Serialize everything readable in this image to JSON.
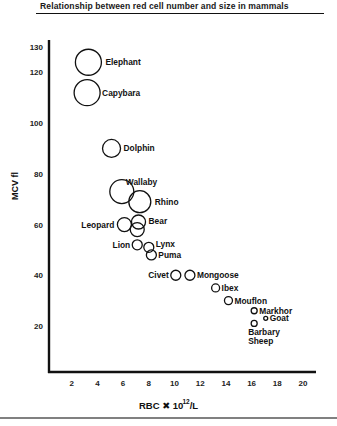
{
  "chart_data": {
    "type": "scatter",
    "title": "Relationship between red cell number and size in mammals",
    "xlabel": "RBC × 10^12/L",
    "xlabel_parts": {
      "base": "RBC ",
      "times": "✖",
      "number": " 10",
      "exponent": "12",
      "unit": "/L"
    },
    "ylabel": "MCV fl",
    "xlim": [
      0,
      21
    ],
    "ylim": [
      0,
      132
    ],
    "x_ticks": [
      "2",
      "4",
      "6",
      "8",
      "10",
      "12",
      "14",
      "16",
      "18",
      "20"
    ],
    "y_ticks": [
      "20",
      "40",
      "60",
      "80",
      "100",
      "120",
      "130"
    ],
    "grid": false,
    "legend": "none",
    "marker": "open circle, size proportional to cell size",
    "points": [
      {
        "label": "Elephant",
        "x": 3.3,
        "y": 124,
        "r": 13
      },
      {
        "label": "Capybara",
        "x": 3.2,
        "y": 112,
        "r": 13
      },
      {
        "label": "Dolphin",
        "x": 5.1,
        "y": 90,
        "r": 9
      },
      {
        "label": "Wallaby",
        "x": 5.9,
        "y": 73,
        "r": 12
      },
      {
        "label": "Rhino",
        "x": 7.3,
        "y": 69,
        "r": 11
      },
      {
        "label": "Leopard",
        "x": 6.1,
        "y": 60,
        "r": 7
      },
      {
        "label": "Bear",
        "x": 7.2,
        "y": 61,
        "r": 7
      },
      {
        "label": "",
        "x": 7.1,
        "y": 58,
        "r": 7
      },
      {
        "label": "Lion",
        "x": 7.1,
        "y": 52,
        "r": 5
      },
      {
        "label": "Lynx",
        "x": 8.0,
        "y": 51,
        "r": 5
      },
      {
        "label": "Puma",
        "x": 8.2,
        "y": 48,
        "r": 5
      },
      {
        "label": "Civet",
        "x": 10.1,
        "y": 40,
        "r": 5
      },
      {
        "label": "Mongoose",
        "x": 11.2,
        "y": 40,
        "r": 5
      },
      {
        "label": "Ibex",
        "x": 13.2,
        "y": 35,
        "r": 4
      },
      {
        "label": "Mouflon",
        "x": 14.2,
        "y": 30,
        "r": 4
      },
      {
        "label": "Markhor",
        "x": 16.2,
        "y": 26,
        "r": 3
      },
      {
        "label": "Goat",
        "x": 17.1,
        "y": 23,
        "r": 2
      },
      {
        "label": "Barbary Sheep",
        "x": 16.2,
        "y": 21,
        "r": 3
      }
    ]
  },
  "figure": {
    "title": "Relationship between red cell number and size in mammals",
    "ylabel": "MCV  fl",
    "xlabel_main": "RBC ✖ 10",
    "xlabel_exp": "12",
    "xlabel_unit": "/L"
  }
}
